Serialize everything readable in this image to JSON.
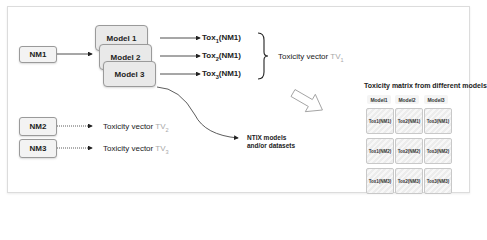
{
  "inputs": [
    {
      "label": "NM1"
    },
    {
      "label": "NM2"
    },
    {
      "label": "NM3"
    }
  ],
  "models": [
    {
      "label": "Model 1"
    },
    {
      "label": "Model 2"
    },
    {
      "label": "Model 3"
    }
  ],
  "outputs": [
    {
      "prefix": "Tox",
      "sub": "1",
      "suffix": "(NM1)"
    },
    {
      "prefix": "Tox",
      "sub": "2",
      "suffix": "(NM1)"
    },
    {
      "prefix": "Tox",
      "sub": "3",
      "suffix": "(NM1)"
    }
  ],
  "vectors": [
    {
      "label": "Toxicity vector ",
      "tv": "TV",
      "sub": "1"
    },
    {
      "label": "Toxicity vector ",
      "tv": "TV",
      "sub": "2"
    },
    {
      "label": "Toxicity vector ",
      "tv": "TV",
      "sub": "3"
    }
  ],
  "ntix": {
    "line1": "NTIX models",
    "line2": "and/or datasets"
  },
  "matrix": {
    "title": "Toxicity matrix from different models",
    "headers": [
      "Model1",
      "Model2",
      "Model3"
    ],
    "rows": [
      [
        "Tox1(NM1)",
        "Tox2(NM1)",
        "Tox3(NM1)"
      ],
      [
        "Tox1(NM2)",
        "Tox2(NM2)",
        "Tox3(NM2)"
      ],
      [
        "Tox1(NM3)",
        "Tox2(NM3)",
        "Tox3(NM3)"
      ]
    ]
  },
  "colors": {
    "tv_gray": "#a8a8a8",
    "box_border": "#9a9a9a",
    "arrow": "#222222"
  }
}
